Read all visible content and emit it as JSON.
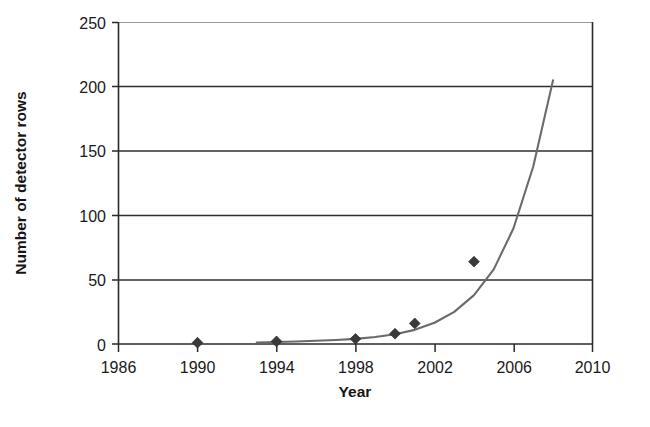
{
  "chart_data": {
    "type": "scatter",
    "title": "",
    "xlabel": "Year",
    "ylabel": "Number of detector rows",
    "xlim": [
      1986,
      2010
    ],
    "ylim": [
      0,
      250
    ],
    "xticks": [
      1986,
      1990,
      1994,
      1998,
      2002,
      2006,
      2010
    ],
    "xticklabels": [
      "1986",
      "1990",
      "1994",
      "1998",
      "2002",
      "2006",
      "2010"
    ],
    "yticks": [
      0,
      50,
      100,
      150,
      200,
      250
    ],
    "yticklabels": [
      "0",
      "50",
      "100",
      "150",
      "200",
      "250"
    ],
    "grid": "horizontal",
    "legend": "none",
    "marker_style": "filled-diamond",
    "marker_color": "#3a3a3a",
    "curve_color": "#6a6a6a",
    "points": [
      {
        "x": 1990,
        "y": 1
      },
      {
        "x": 1994,
        "y": 2
      },
      {
        "x": 1998,
        "y": 4
      },
      {
        "x": 2000,
        "y": 8
      },
      {
        "x": 2001,
        "y": 16
      },
      {
        "x": 2004,
        "y": 64
      }
    ],
    "series": [
      {
        "name": "Exponential trend fit",
        "type": "line",
        "x": [
          1993,
          1994,
          1995,
          1996,
          1997,
          1998,
          1999,
          2000,
          2001,
          2002,
          2003,
          2004,
          2005,
          2006,
          2007,
          2008
        ],
        "values": [
          1.2,
          1.6,
          2.0,
          2.5,
          3.1,
          4.0,
          5.4,
          7.6,
          11.0,
          16.5,
          25.0,
          38.0,
          58.0,
          90.0,
          138.0,
          205.0
        ]
      }
    ],
    "annotations": []
  },
  "axis": {
    "y_title": "Number of detector rows",
    "x_title": "Year"
  }
}
